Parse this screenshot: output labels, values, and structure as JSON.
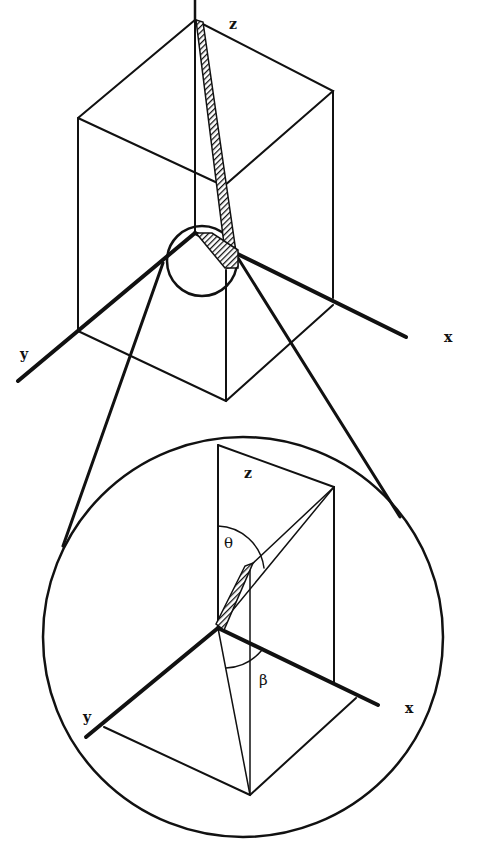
{
  "figure": {
    "type": "3D orientation diagram with magnified inset",
    "top_view": {
      "axis_labels": {
        "z": "z",
        "x": "x",
        "y": "y"
      },
      "description": "Rectangular box with hatched rod along z axis; small circle at origin highlighting base"
    },
    "inset_view": {
      "axis_labels": {
        "z": "z",
        "x": "x",
        "y": "y"
      },
      "angle_labels": {
        "theta": "θ",
        "beta": "β"
      },
      "description": "Magnified view showing rod tilted by polar angle θ from z and azimuthal angle β in xy-plane"
    },
    "colors": {
      "line": "#111111",
      "background": "#ffffff"
    }
  }
}
